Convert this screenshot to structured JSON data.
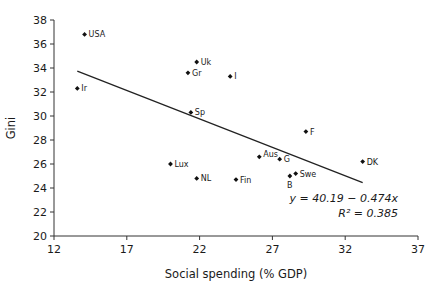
{
  "chart_data": {
    "type": "scatter",
    "title": "",
    "xlabel": "Social spending (% GDP)",
    "ylabel": "Gini",
    "xlim": [
      12,
      37
    ],
    "ylim": [
      20,
      38
    ],
    "xticks": [
      12,
      17,
      22,
      27,
      32,
      37
    ],
    "yticks": [
      20,
      22,
      24,
      26,
      28,
      30,
      32,
      34,
      36,
      38
    ],
    "grid": false,
    "legend": null,
    "points": [
      {
        "label": "USA",
        "x": 14.1,
        "y": 36.8
      },
      {
        "label": "Ir",
        "x": 13.6,
        "y": 32.3
      },
      {
        "label": "Uk",
        "x": 21.8,
        "y": 34.5
      },
      {
        "label": "Gr",
        "x": 21.2,
        "y": 33.6
      },
      {
        "label": "I",
        "x": 24.1,
        "y": 33.3
      },
      {
        "label": "Sp",
        "x": 21.4,
        "y": 30.3
      },
      {
        "label": "F",
        "x": 29.3,
        "y": 28.7
      },
      {
        "label": "Lux",
        "x": 20.0,
        "y": 26.0
      },
      {
        "label": "NL",
        "x": 21.8,
        "y": 24.8
      },
      {
        "label": "Fin",
        "x": 24.5,
        "y": 24.7
      },
      {
        "label": "Aus",
        "x": 26.1,
        "y": 26.6
      },
      {
        "label": "G",
        "x": 27.5,
        "y": 26.4
      },
      {
        "label": "B",
        "x": 28.2,
        "y": 25.0
      },
      {
        "label": "Swe",
        "x": 28.6,
        "y": 25.2
      },
      {
        "label": "DK",
        "x": 33.2,
        "y": 26.2
      }
    ],
    "trendline": {
      "intercept": 40.19,
      "slope": -0.474,
      "x_range": [
        13.6,
        33.2
      ],
      "equation": "y = 40.19 − 0.474x",
      "r_squared_label": "R² = 0.385"
    }
  }
}
